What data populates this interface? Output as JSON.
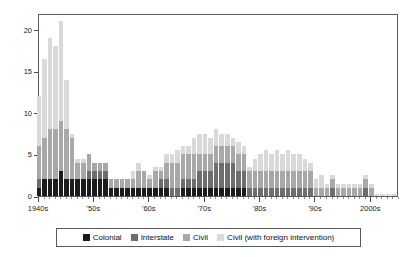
{
  "chart_data": {
    "type": "bar",
    "subtype": "stacked-bar",
    "title": "",
    "subtitle": "",
    "xlabel": "",
    "ylabel": "",
    "xlim": [
      1940,
      2005
    ],
    "ylim": [
      0,
      22
    ],
    "yticks": [
      0,
      5,
      10,
      15,
      20
    ],
    "ytick_labels": [
      "0",
      "5",
      "10",
      "15",
      "20"
    ],
    "grid": false,
    "legend_position": "below-axes",
    "x_tick_labels": [
      "1940s",
      "'50s",
      "'60s",
      "'70s",
      "'80s",
      "'90s",
      "2000s"
    ],
    "x_tick_values": [
      1940,
      1950,
      1960,
      1970,
      1980,
      1990,
      2000
    ],
    "series": [
      {
        "name": "Colonial",
        "color": "#1b1b1b",
        "values": [
          1.0,
          2.0,
          2.0,
          2.0,
          3.0,
          2.0,
          2.0,
          2.0,
          2.0,
          2.0,
          2.0,
          2.0,
          2.0,
          1.0,
          1.0,
          1.0,
          1.0,
          1.0,
          1.0,
          1.0,
          1.0,
          1.0,
          1.0,
          1.0,
          0.0,
          0.0,
          1.0,
          1.0,
          1.0,
          1.0,
          1.0,
          1.0,
          1.0,
          1.0,
          1.0,
          1.0,
          1.0,
          1.0,
          0.0,
          0.0,
          0.0,
          0.0,
          0.0,
          0.0,
          0.0,
          0.0,
          0.0,
          0.0,
          0.0,
          0.0,
          0.0,
          0.0,
          0.0,
          0.0,
          0.0,
          0.0,
          0.0,
          0.0,
          0.0,
          0.0,
          0.0,
          0.0,
          0.0,
          0.0,
          0.0
        ]
      },
      {
        "name": "Interstate",
        "color": "#6e6e6e",
        "values": [
          1.0,
          0.0,
          0.0,
          0.0,
          0.0,
          0.0,
          0.0,
          0.0,
          0.0,
          1.0,
          1.0,
          1.0,
          1.0,
          0.0,
          0.0,
          0.0,
          0.0,
          0.0,
          0.0,
          0.0,
          0.0,
          0.0,
          1.0,
          1.0,
          1.0,
          1.0,
          1.0,
          1.0,
          1.0,
          2.0,
          2.0,
          2.0,
          3.0,
          3.0,
          3.0,
          3.0,
          2.0,
          2.0,
          1.0,
          1.0,
          1.0,
          1.0,
          1.0,
          1.0,
          1.0,
          1.0,
          1.0,
          1.0,
          1.0,
          1.0,
          0.0,
          0.0,
          0.0,
          1.0,
          0.0,
          0.0,
          0.0,
          0.0,
          0.0,
          1.0,
          0.0,
          0.0,
          0.0,
          0.0,
          0.0
        ]
      },
      {
        "name": "Civil",
        "color": "#a8a8a8",
        "values": [
          4.0,
          5.0,
          6.0,
          6.0,
          6.0,
          6.0,
          5.0,
          2.0,
          2.0,
          2.0,
          1.0,
          1.0,
          1.0,
          1.0,
          1.0,
          1.0,
          1.0,
          1.0,
          2.0,
          2.0,
          1.0,
          2.0,
          1.0,
          2.0,
          3.0,
          3.0,
          3.0,
          3.0,
          3.0,
          2.0,
          2.0,
          2.0,
          2.0,
          2.0,
          2.0,
          2.0,
          2.0,
          2.0,
          2.0,
          2.0,
          2.0,
          2.0,
          2.0,
          2.0,
          2.0,
          2.0,
          2.0,
          2.0,
          2.0,
          2.0,
          1.0,
          1.0,
          1.0,
          1.0,
          1.0,
          1.0,
          1.0,
          1.0,
          1.0,
          1.0,
          1.0,
          0.0,
          0.0,
          0.0,
          0.0
        ]
      },
      {
        "name": "Civil (with foreign intervention)",
        "color": "#d9d9d9",
        "values": [
          6.0,
          9.5,
          11.0,
          10.0,
          12.0,
          6.0,
          0.5,
          0.5,
          0.5,
          0.0,
          0.0,
          0.0,
          0.0,
          0.0,
          0.0,
          0.0,
          0.0,
          1.0,
          1.0,
          0.0,
          0.5,
          0.5,
          0.5,
          1.0,
          1.0,
          1.5,
          1.0,
          1.0,
          2.0,
          2.5,
          2.5,
          2.0,
          2.0,
          1.5,
          1.5,
          1.0,
          1.5,
          1.0,
          0.5,
          1.5,
          2.0,
          2.5,
          2.0,
          2.5,
          2.0,
          2.5,
          2.0,
          2.0,
          1.5,
          1.0,
          1.0,
          1.5,
          0.5,
          0.5,
          0.5,
          0.5,
          0.5,
          0.5,
          0.5,
          0.5,
          0.5,
          0.3,
          0.2,
          0.2,
          0.2
        ]
      }
    ],
    "x_values": [
      1940,
      1941,
      1942,
      1943,
      1944,
      1945,
      1946,
      1947,
      1948,
      1949,
      1950,
      1951,
      1952,
      1953,
      1954,
      1955,
      1956,
      1957,
      1958,
      1959,
      1960,
      1961,
      1962,
      1963,
      1964,
      1965,
      1966,
      1967,
      1968,
      1969,
      1970,
      1971,
      1972,
      1973,
      1974,
      1975,
      1976,
      1977,
      1978,
      1979,
      1980,
      1981,
      1982,
      1983,
      1984,
      1985,
      1986,
      1987,
      1988,
      1989,
      1990,
      1991,
      1992,
      1993,
      1994,
      1995,
      1996,
      1997,
      1998,
      1999,
      2000,
      2001,
      2002,
      2003,
      2004
    ],
    "totals": [
      12.0,
      16.5,
      19.0,
      18.0,
      21.0,
      15.0,
      7.5,
      4.5,
      4.5,
      5.0,
      4.0,
      4.0,
      4.0,
      2.0,
      2.0,
      2.0,
      2.0,
      3.0,
      4.0,
      3.0,
      2.5,
      3.5,
      3.5,
      5.0,
      5.0,
      5.5,
      6.0,
      6.0,
      7.0,
      7.5,
      7.5,
      7.0,
      8.0,
      7.5,
      7.5,
      7.0,
      6.5,
      6.0,
      3.5,
      4.5,
      5.0,
      5.5,
      5.0,
      5.5,
      5.0,
      5.5,
      5.0,
      5.0,
      4.5,
      4.0,
      2.0,
      2.5,
      1.5,
      2.5,
      1.5,
      1.5,
      1.5,
      1.5,
      1.5,
      2.5,
      1.5,
      0.3,
      0.2,
      0.2,
      0.2
    ]
  },
  "legend": {
    "items": [
      {
        "label": "Colonial",
        "color": "#1b1b1b"
      },
      {
        "label": "Interstate",
        "color": "#6e6e6e"
      },
      {
        "label": "Civil",
        "color": "#a8a8a8"
      },
      {
        "label": "Civil (with foreign intervention)",
        "color": "#d9d9d9"
      }
    ]
  },
  "axes": {
    "y_labels": [
      "0",
      "5",
      "10",
      "15",
      "20"
    ],
    "x_labels": [
      "1940s",
      "'50s",
      "'60s",
      "'70s",
      "'80s",
      "'90s",
      "2000s"
    ]
  }
}
